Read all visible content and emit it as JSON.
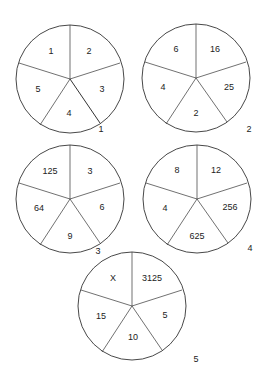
{
  "puzzle": {
    "circles": [
      {
        "number": "1",
        "segments": {
          "top_left": "1",
          "top_right": "2",
          "right": "3",
          "bottom": "4",
          "left": "5"
        }
      },
      {
        "number": "2",
        "segments": {
          "top_left": "6",
          "top_right": "16",
          "right": "25",
          "bottom": "2",
          "left": "4"
        }
      },
      {
        "number": "3",
        "segments": {
          "top_left": "125",
          "top_right": "3",
          "right": "6",
          "bottom": "9",
          "left": "64"
        }
      },
      {
        "number": "4",
        "segments": {
          "top_left": "8",
          "top_right": "12",
          "right": "256",
          "bottom": "625",
          "left": "4"
        }
      },
      {
        "number": "5",
        "segments": {
          "top_left": "X",
          "top_right": "3125",
          "right": "5",
          "bottom": "10",
          "left": "15"
        }
      }
    ]
  },
  "colors": {
    "line": "#333333",
    "text": "#222222",
    "background": "#ffffff"
  }
}
